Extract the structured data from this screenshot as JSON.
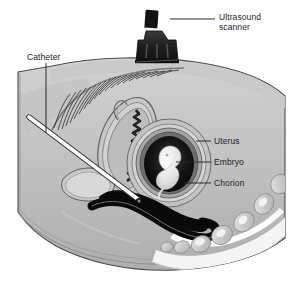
{
  "figure": {
    "type": "medical-illustration",
    "view": "mid-sagittal cross-section of female pelvis"
  },
  "labels": [
    {
      "id": "ultrasound-scanner",
      "text": "Ultrasound\nscanner",
      "line1": "Ultrasound",
      "line2": "scanner",
      "x": 219,
      "y": 12,
      "leader": {
        "x1": 170,
        "y1": 19,
        "x2": 215,
        "y2": 19
      }
    },
    {
      "id": "catheter",
      "text": "Catheter",
      "x": 27,
      "y": 52,
      "leader": {
        "x1": 46,
        "y1": 63,
        "x2": 46,
        "y2": 133
      }
    },
    {
      "id": "uterus",
      "text": "Uterus",
      "x": 214,
      "y": 136,
      "leader": {
        "x1": 196,
        "y1": 141,
        "x2": 211,
        "y2": 141
      }
    },
    {
      "id": "embryo",
      "text": "Embryo",
      "x": 214,
      "y": 157,
      "leader": {
        "x1": 176,
        "y1": 162,
        "x2": 211,
        "y2": 162
      }
    },
    {
      "id": "chorion",
      "text": "Chorion",
      "x": 214,
      "y": 178,
      "leader": {
        "x1": 184,
        "y1": 183,
        "x2": 211,
        "y2": 183
      }
    }
  ],
  "anatomy": [
    {
      "id": "abdomen-body",
      "label": "maternal abdomen and pelvis"
    },
    {
      "id": "uterine-wall",
      "label": "uterine wall"
    },
    {
      "id": "endometrial-cavity",
      "label": "endometrial cavity"
    },
    {
      "id": "gestational-sac",
      "label": "gestational sac"
    },
    {
      "id": "embryo-body",
      "label": "embryo"
    },
    {
      "id": "chorion-ring",
      "label": "chorion"
    },
    {
      "id": "bladder",
      "label": "urinary bladder"
    },
    {
      "id": "rectum",
      "label": "rectum"
    },
    {
      "id": "sacrum-vertebrae",
      "label": "sacral vertebrae"
    },
    {
      "id": "pubic-hair",
      "label": "pubic hair"
    },
    {
      "id": "catheter-rod",
      "label": "sampling catheter"
    },
    {
      "id": "scanner-probe",
      "label": "ultrasound transducer"
    }
  ],
  "colors": {
    "background": "#ffffff",
    "skin_light": "#cfcfcf",
    "skin_mid": "#b9b9b9",
    "skin_dark": "#a3a3a3",
    "tissue_light": "#dcdcdc",
    "outline": "#4a4a4a",
    "cavity_dark": "#0d0d0d",
    "embryo_pale": "#ededed",
    "bone_light": "#f2f2f2",
    "probe_dark": "#1a1a1a",
    "catheter_white": "#fdfdfd",
    "label_text": "#1d1d1d",
    "leader_line": "#2b2b2b"
  }
}
